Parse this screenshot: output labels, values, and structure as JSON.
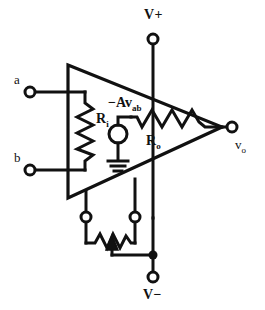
{
  "figure": {
    "kind": "circuit-diagram",
    "stroke_color": "#111111",
    "background_color": "#ffffff"
  },
  "labels": {
    "input_a": "a",
    "input_b": "b",
    "input_resistance": "R",
    "input_resistance_sub": "i",
    "output_resistance": "R",
    "output_resistance_sub": "o",
    "dependent_source": "−Av",
    "dependent_source_sub": "ab",
    "output_node": "v",
    "output_node_sub": "o",
    "supply_positive": "V+",
    "supply_negative": "V−"
  },
  "components": {
    "amplifier_triangle": {
      "name": "op-amp-triangle",
      "left_x": 68,
      "top_y": 65,
      "bottom_y": 198,
      "apex_x": 222,
      "apex_y": 127
    },
    "terminal_a": {
      "cx": 30,
      "cy": 92,
      "r": 5
    },
    "terminal_b": {
      "cx": 30,
      "cy": 170,
      "r": 5
    },
    "terminal_vplus": {
      "cx": 153,
      "cy": 39,
      "r": 5
    },
    "terminal_vminus": {
      "cx": 153,
      "cy": 277,
      "r": 5
    },
    "terminal_vout": {
      "cx": 232,
      "cy": 127,
      "r": 5
    },
    "pot_terminal_left": {
      "cx": 86,
      "cy": 217,
      "r": 5
    },
    "pot_terminal_right": {
      "cx": 135,
      "cy": 217,
      "r": 5
    },
    "source_circle": {
      "cx": 118,
      "cy": 134,
      "r": 9
    },
    "junction_dot": {
      "cx": 153,
      "cy": 255,
      "r": 4
    }
  }
}
